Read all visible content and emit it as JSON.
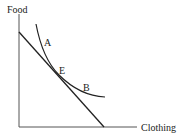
{
  "diagram": {
    "type": "indifference-curve-budget-line",
    "axes": {
      "y_label": "Food",
      "x_label": "Clothing"
    },
    "points": {
      "A": "A",
      "E": "E",
      "B": "B"
    },
    "colors": {
      "axis": "#555555",
      "line": "#222222",
      "background": "#ffffff"
    }
  }
}
